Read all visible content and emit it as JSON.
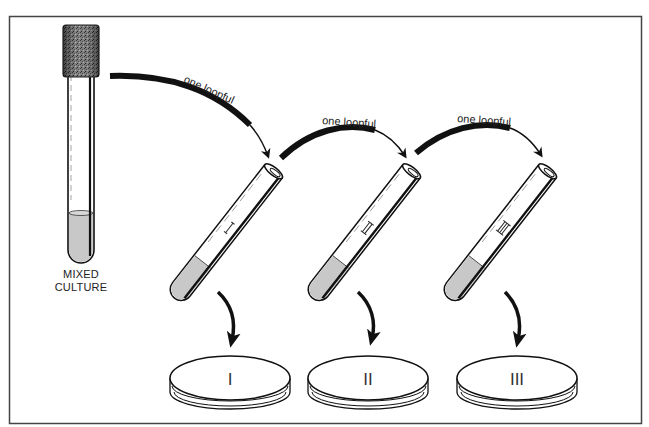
{
  "diagram": {
    "source": {
      "label_line1": "MIXED",
      "label_line2": "CULTURE"
    },
    "transfers": [
      {
        "label": "one loopful"
      },
      {
        "label": "one loopful"
      },
      {
        "label": "one loopful"
      }
    ],
    "tubes": [
      {
        "marking": "I"
      },
      {
        "marking": "II"
      },
      {
        "marking": "III"
      }
    ],
    "plates": [
      {
        "label": "I"
      },
      {
        "label": "II"
      },
      {
        "label": "III"
      }
    ],
    "colors": {
      "ink": "#111111",
      "liquid": "#c8c8c8",
      "stopper": "#6e6e6e",
      "frame": "#444444",
      "background": "#ffffff"
    }
  }
}
